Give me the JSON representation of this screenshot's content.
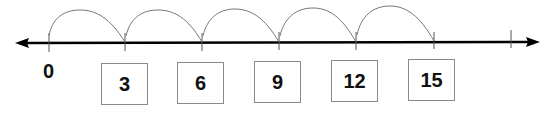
{
  "number_line": {
    "start_label": "0",
    "step": 3,
    "tick_values": [
      0,
      3,
      6,
      9,
      12,
      15,
      18
    ],
    "boxed_labels": [
      "3",
      "6",
      "9",
      "12",
      "15"
    ],
    "jumps": 5,
    "line_color": "#000000",
    "arc_color": "#777777",
    "box_border_color": "#8a8a8a"
  }
}
